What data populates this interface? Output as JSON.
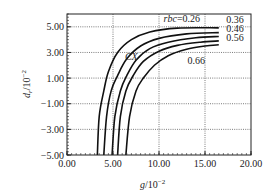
{
  "chart_data": {
    "type": "line",
    "title": "",
    "xlabel": "g/10^-2",
    "ylabel": "d_r/10^-2",
    "xlim": [
      0,
      20
    ],
    "ylim": [
      -5,
      6
    ],
    "xticks": [
      0,
      5,
      10,
      15,
      20
    ],
    "xtick_labels": [
      "0.00",
      "5.00",
      "10.00",
      "15.00",
      "20.00"
    ],
    "yticks": [
      -5,
      -3,
      -1,
      1,
      3,
      5
    ],
    "ytick_labels": [
      "−5.00",
      "−3.00",
      "−1.00",
      "1.00",
      "3.00",
      "5.00"
    ],
    "grid": true,
    "legend_position": "inline labels at curve ends",
    "series": [
      {
        "name": "rbc=0.26",
        "label": "rbc=0.26",
        "points": [
          [
            3.3,
            -5
          ],
          [
            3.5,
            -2
          ],
          [
            4.0,
            0
          ],
          [
            4.5,
            1.5
          ],
          [
            5.5,
            3
          ],
          [
            7,
            4
          ],
          [
            9,
            4.6
          ],
          [
            12,
            4.9
          ],
          [
            16.5,
            4.92
          ]
        ]
      },
      {
        "name": "0.36",
        "label": "0.36",
        "points": [
          [
            4.0,
            -5
          ],
          [
            4.3,
            -2
          ],
          [
            4.8,
            0
          ],
          [
            5.5,
            1.2
          ],
          [
            6.5,
            2.5
          ],
          [
            8,
            3.5
          ],
          [
            10,
            4.1
          ],
          [
            13,
            4.45
          ],
          [
            16.5,
            4.55
          ]
        ]
      },
      {
        "name": "0.46",
        "label": "0.46",
        "points": [
          [
            4.9,
            -5
          ],
          [
            5.2,
            -2
          ],
          [
            5.8,
            0
          ],
          [
            6.5,
            1.2
          ],
          [
            7.5,
            2.4
          ],
          [
            9,
            3.3
          ],
          [
            11,
            3.8
          ],
          [
            14,
            4.15
          ],
          [
            16.5,
            4.25
          ]
        ]
      },
      {
        "name": "0.56",
        "label": "0.56",
        "points": [
          [
            5.5,
            -5
          ],
          [
            5.8,
            -2
          ],
          [
            6.4,
            0
          ],
          [
            7.2,
            1.2
          ],
          [
            8.3,
            2.3
          ],
          [
            10,
            3.1
          ],
          [
            12,
            3.55
          ],
          [
            14.5,
            3.8
          ],
          [
            16.5,
            3.9
          ]
        ]
      },
      {
        "name": "0.66",
        "label": "0.66",
        "points": [
          [
            6.4,
            -5
          ],
          [
            6.8,
            -2
          ],
          [
            7.5,
            0
          ],
          [
            8.3,
            1
          ],
          [
            9.5,
            2
          ],
          [
            11,
            2.75
          ],
          [
            13,
            3.25
          ],
          [
            15,
            3.5
          ],
          [
            16.5,
            3.6
          ]
        ]
      }
    ],
    "annotations": [
      {
        "text": "CX",
        "x": 6.3,
        "y": 2.4
      },
      {
        "text": "rbc=0.26",
        "x": 10.5,
        "y": 5.4
      },
      {
        "text": "0.36",
        "x": 17.3,
        "y": 5.3
      },
      {
        "text": "0.46",
        "x": 17.3,
        "y": 4.6
      },
      {
        "text": "0.56",
        "x": 17.3,
        "y": 3.9
      },
      {
        "text": "0.66",
        "x": 13.1,
        "y": 2.1
      }
    ]
  },
  "labels": {
    "xlabel_main": "g",
    "xlabel_unit": "/10",
    "xlabel_exp": "−2",
    "ylabel_main": "d",
    "ylabel_sub": "r",
    "ylabel_unit": "/10",
    "ylabel_exp": "−2"
  }
}
